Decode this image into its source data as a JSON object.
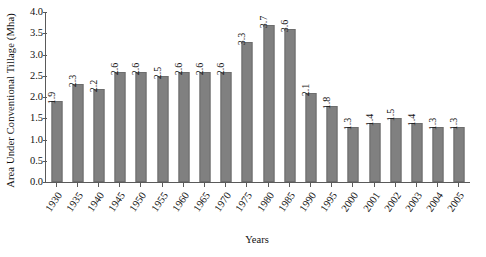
{
  "chart_data": {
    "type": "bar",
    "title": "",
    "xlabel": "Years",
    "ylabel": "Area Under Conventional Tillage (Mha)",
    "ylim": [
      0.0,
      4.0
    ],
    "ytick_step": 0.5,
    "yticks": [
      "0.0",
      "0.5",
      "1.0",
      "1.5",
      "2.0",
      "2.5",
      "3.0",
      "3.5",
      "4.0"
    ],
    "grid": false,
    "legend": "none",
    "bar_color": "#808080",
    "bar_edge_color": "#6d6d6d",
    "axis_color": "#5a5a5a",
    "value_labels_rotated": true,
    "categories": [
      "1930",
      "1935",
      "1940",
      "1945",
      "1950",
      "1955",
      "1960",
      "1965",
      "1970",
      "1975",
      "1980",
      "1985",
      "1990",
      "1995",
      "2000",
      "2001",
      "2002",
      "2003",
      "2004",
      "2005"
    ],
    "values": [
      1.9,
      2.3,
      2.2,
      2.6,
      2.6,
      2.5,
      2.6,
      2.6,
      2.6,
      3.3,
      3.7,
      3.6,
      2.1,
      1.8,
      1.3,
      1.4,
      1.5,
      1.4,
      1.3,
      1.3
    ],
    "value_labels": [
      "1.9",
      "2.3",
      "2.2",
      "2.6",
      "2.6",
      "2.5",
      "2.6",
      "2.6",
      "2.6",
      "3.3",
      "3.7",
      "3.6",
      "2.1",
      "1.8",
      "1.3",
      "1.4",
      "1.5",
      "1.4",
      "1.3",
      "1.3"
    ]
  }
}
